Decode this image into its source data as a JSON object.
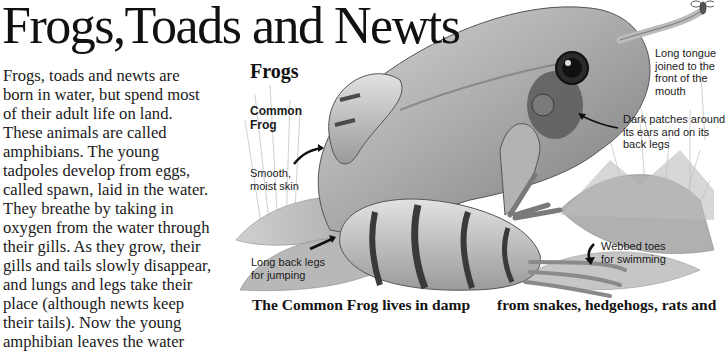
{
  "page": {
    "title": "Frogs,Toads and Newts",
    "intro_lines": [
      "Frogs, toads and newts are",
      "born in water, but spend most",
      "of their adult life on land.",
      "These animals are called",
      "amphibians. The young",
      "tadpoles develop from eggs,",
      "called spawn, laid in the water.",
      "They breathe by taking in",
      "oxygen from the water through",
      "their gills. As they grow, their",
      "gills and tails slowly disappear,",
      "and lungs and legs take their",
      "place (although newts keep",
      "their tails). Now the young",
      "amphibian leaves the water"
    ]
  },
  "section": {
    "heading": "Frogs",
    "species_label_line1": "Common",
    "species_label_line2": "Frog"
  },
  "annotations": {
    "skin_line1": "Smooth,",
    "skin_line2": "moist skin",
    "legs_line1": "Long back legs",
    "legs_line2": "for jumping",
    "tongue_line1": "Long tongue",
    "tongue_line2": "joined to the",
    "tongue_line3": "front of the",
    "tongue_line4": "mouth",
    "patches_line1": "Dark patches around",
    "patches_line2": "its ears and on its",
    "patches_line3": "back legs",
    "toes_line1": "Webbed toes",
    "toes_line2": "for swimming"
  },
  "captions": {
    "left": "The Common Frog lives in damp",
    "right": "from snakes, hedgehogs, rats and"
  },
  "colors": {
    "background": "#ffffff",
    "text": "#141414",
    "frog_light": "#c8c8c8",
    "frog_mid": "#8a8a8a",
    "frog_dark": "#3a3a3a"
  }
}
